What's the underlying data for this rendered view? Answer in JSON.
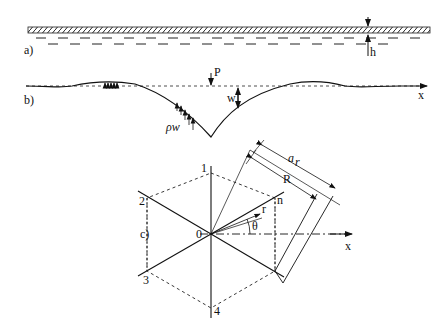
{
  "figure": {
    "panels": [
      {
        "id": "a",
        "label": "a)",
        "description": "plate (hatched) floating on liquid, thickness h",
        "thickness_label": "h"
      },
      {
        "id": "b",
        "label": "b)",
        "description": "deflection profile under point load P",
        "load_label": "P",
        "deflection_label": "w",
        "pressure_label": "ρw",
        "axis_label": "x"
      },
      {
        "id": "c",
        "label": "c)",
        "description": "hexagonal sector discretization",
        "node_labels": [
          "1",
          "2",
          "3",
          "4",
          "n",
          "0"
        ],
        "radius_label": "r",
        "angle_label": "θ",
        "outer_radius_label": "R",
        "ring_label": "a",
        "ring_subscript": "r",
        "axis_label": "x"
      }
    ]
  }
}
